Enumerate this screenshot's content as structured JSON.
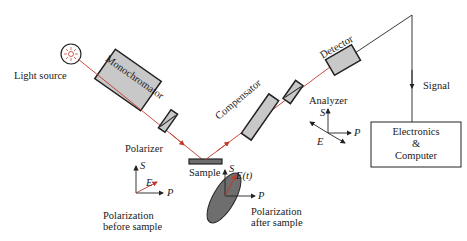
{
  "labels": {
    "light_source": "Light source",
    "monochromator": "Monochromator",
    "polarizer": "Polarizer",
    "sample": "Sample",
    "compensator": "Compensator",
    "analyzer": "Analyzer",
    "detector": "Detector",
    "signal": "Signal",
    "electronics_line1": "Electronics",
    "electronics_line2": "&",
    "electronics_line3": "Computer",
    "pol_before_line1": "Polarization",
    "pol_before_line2": "before sample",
    "pol_after_line1": "Polarization",
    "pol_after_line2": "after sample"
  },
  "axes": {
    "s": "S",
    "p": "P",
    "e": "E",
    "et": "E(t)"
  },
  "colors": {
    "beam": "#c0392b",
    "component_fill": "#c8c8c8",
    "ellipse_fill": "#6e6e6e",
    "outline": "#222222"
  }
}
